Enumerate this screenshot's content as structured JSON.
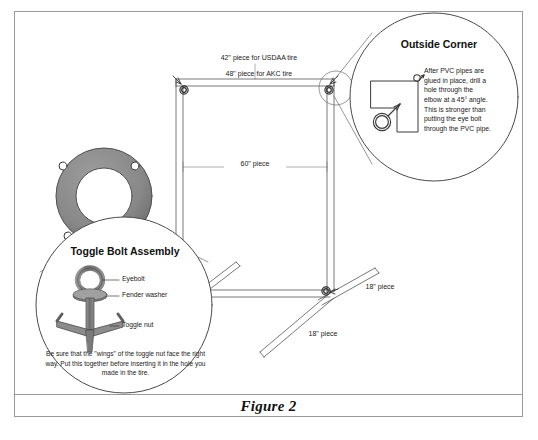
{
  "figure": {
    "caption": "Figure 2"
  },
  "main_diagram": {
    "dimensions": [
      {
        "id": "top-bar",
        "line1": "42\" piece for USDAA tire",
        "line2": "48\" piece for AKC tire"
      },
      {
        "id": "crossbar",
        "label": "60\" piece"
      },
      {
        "id": "foot-right",
        "label": "18\" piece"
      },
      {
        "id": "foot-left",
        "label": "18\" piece"
      }
    ],
    "tire": {
      "name": "tire",
      "color": "#8a8a8a",
      "bolt_holes": 4
    }
  },
  "callouts": [
    {
      "id": "outside-corner",
      "title": "Outside Corner",
      "body": "After PVC pipes are glued in place, drill a hole through the elbow at a 45° angle. This is stronger than putting the eye bolt through the PVC pipe."
    },
    {
      "id": "toggle-bolt-assembly",
      "title": "Toggle Bolt Assembly",
      "parts": [
        {
          "name": "eyebolt",
          "label": "Eyebolt"
        },
        {
          "name": "fender-washer",
          "label": "Fender washer"
        },
        {
          "name": "toggle-nut",
          "label": "Toggle nut"
        }
      ],
      "footnote": "Be sure that the \"wings\" of the toggle nut face the right way. Put this together before inserting it in the hole you made in the tire."
    }
  ],
  "colors": {
    "border": "#9a9a9a",
    "line": "#555555",
    "tire_gray": "#8a8a8a",
    "hardware_gray": "#7d7d7d",
    "ink": "#1a1a1a"
  }
}
